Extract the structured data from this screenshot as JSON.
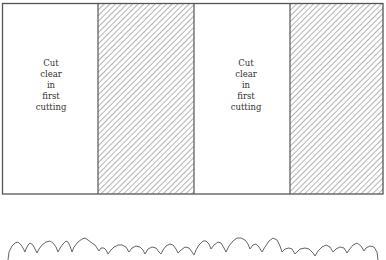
{
  "diagram": {
    "type": "strip-cutting plan",
    "strips": [
      {
        "kind": "cleared",
        "label_lines": [
          "Cut",
          "clear",
          "in",
          "first",
          "cutting"
        ]
      },
      {
        "kind": "standing",
        "pattern": "diagonal-hatch"
      },
      {
        "kind": "cleared",
        "label_lines": [
          "Cut",
          "clear",
          "in",
          "first",
          "cutting"
        ]
      },
      {
        "kind": "standing",
        "pattern": "diagonal-hatch"
      }
    ],
    "colors": {
      "outline": "#555555",
      "hatch": "#8a8a8a",
      "background": "#ffffff",
      "tree_line": "#666666"
    },
    "profile": "tree-crown silhouette of the forest edge"
  }
}
